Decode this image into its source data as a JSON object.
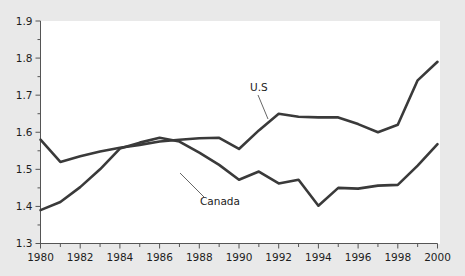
{
  "chart_data": {
    "type": "line",
    "title": "",
    "subtitle": "",
    "xlabel": "",
    "ylabel": "",
    "xlim": [
      1980,
      2000
    ],
    "ylim": [
      1.3,
      1.9
    ],
    "grid": false,
    "legend_position": "inline-annotation",
    "x": [
      1980,
      1981,
      1982,
      1983,
      1984,
      1985,
      1986,
      1987,
      1988,
      1989,
      1990,
      1991,
      1992,
      1993,
      1994,
      1995,
      1996,
      1997,
      1998,
      1999,
      2000
    ],
    "y_tick_labels": [
      "1.3",
      "1.4",
      "1.5",
      "1.6",
      "1.7",
      "1.8",
      "1.9"
    ],
    "y_ticks": [
      1.3,
      1.4,
      1.5,
      1.6,
      1.7,
      1.8,
      1.9
    ],
    "x_tick_labels": [
      "1980",
      "1982",
      "1984",
      "1986",
      "1988",
      "1990",
      "1992",
      "1994",
      "1996",
      "1998",
      "2000"
    ],
    "x_ticks": [
      1980,
      1982,
      1984,
      1986,
      1988,
      1990,
      1992,
      1994,
      1996,
      1998,
      2000
    ],
    "x_minor_ticks": [
      1981,
      1983,
      1985,
      1987,
      1989,
      1991,
      1993,
      1995,
      1997,
      1999
    ],
    "y_minor_ticks": [
      1.35,
      1.45,
      1.55,
      1.65,
      1.75,
      1.85
    ],
    "series": [
      {
        "name": "U.S",
        "label": "U.S",
        "color": "#3a3a3a",
        "values": [
          1.58,
          1.52,
          1.535,
          1.548,
          1.558,
          1.566,
          1.575,
          1.58,
          1.584,
          1.585,
          1.555,
          1.605,
          1.65,
          1.642,
          1.64,
          1.64,
          1.622,
          1.6,
          1.62,
          1.74,
          1.79
        ]
      },
      {
        "name": "Canada",
        "label": "Canada",
        "color": "#3a3a3a",
        "values": [
          1.39,
          1.412,
          1.452,
          1.5,
          1.556,
          1.572,
          1.585,
          1.575,
          1.545,
          1.512,
          1.472,
          1.494,
          1.462,
          1.472,
          1.402,
          1.45,
          1.448,
          1.456,
          1.458,
          1.51,
          1.568
        ]
      }
    ],
    "annotations": [
      {
        "text": "U.S",
        "x_px": 250,
        "y_px": 91,
        "leader_to_x_px": 268,
        "leader_to_y_px": 119
      },
      {
        "text": "Canada",
        "x_px": 200,
        "y_px": 205,
        "leader_to_x_px": 180,
        "leader_to_y_px": 173
      }
    ],
    "colors": {
      "line": "#3a3a3a",
      "axis": "#555555",
      "text": "#1d1d1d",
      "plot_background": "#ffffff",
      "page_background": "#e9e9e9"
    }
  }
}
